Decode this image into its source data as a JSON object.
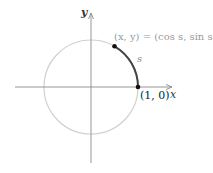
{
  "diagram": {
    "axes": {
      "x_label": "x",
      "y_label": "y"
    },
    "labels": {
      "point_equation": "(x, y) = (cos s, sin s)",
      "arc_label": "s",
      "start_point": "(1, 0)"
    },
    "geometry": {
      "center": [
        91,
        87
      ],
      "radius": 47,
      "arc_start_angle_deg": 0,
      "arc_end_angle_deg": 60
    },
    "colors": {
      "circle": "#d0d0d0",
      "axes": "#8a8a8a",
      "arc": "#444444",
      "points": "#111111",
      "equation_text": "#9a9a9a"
    }
  }
}
